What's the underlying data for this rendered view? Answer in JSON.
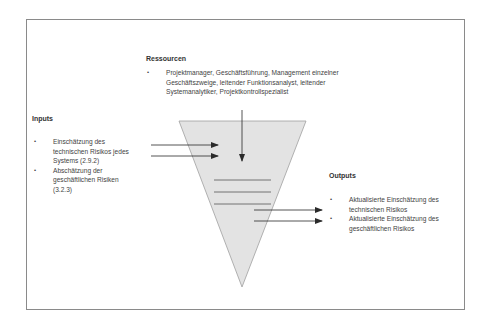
{
  "diagram": {
    "type": "process-funnel",
    "colors": {
      "funnel_fill": "#e3e3e3",
      "funnel_stroke": "#9a9a9a",
      "arrow": "#2a2a2a",
      "frame": "#8a8a8a",
      "text": "#3f3f3f"
    },
    "resources": {
      "heading": "Ressourcen",
      "bullet": "•",
      "items": [
        {
          "lines": [
            "Projektmanager, Geschäftsführung, Management einzelner",
            "Geschäftszweige, leitender Funktionsanalyst, leitender",
            "Systemanalytiker, Projektkontrollspezialist"
          ]
        }
      ]
    },
    "inputs": {
      "heading": "Inputs",
      "bullet": "•",
      "items": [
        {
          "lines": [
            "Einschätzung des",
            "technischen Risikos jedes",
            "Systems (2.9.2)"
          ]
        },
        {
          "lines": [
            "Abschätzung der",
            "geschäftlichen Risiken",
            "(3.2.3)"
          ]
        }
      ]
    },
    "outputs": {
      "heading": "Outputs",
      "bullet": "•",
      "items": [
        {
          "lines": [
            "Aktualisierte Einschätzung des",
            "technischen Risikos"
          ]
        },
        {
          "lines": [
            "Aktualisierte Einschätzung des",
            "geschäftlichen Risikos"
          ]
        }
      ]
    }
  }
}
